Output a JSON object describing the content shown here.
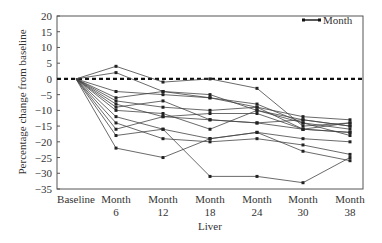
{
  "chart_data": {
    "type": "line",
    "title": "",
    "xlabel": "Liver",
    "ylabel": "Percentage change from baseline",
    "categories": [
      "Baseline",
      "Month 6",
      "Month 12",
      "Month 18",
      "Month 24",
      "Month 30",
      "Month 38"
    ],
    "category_lines": [
      [
        "Baseline"
      ],
      [
        "Month",
        "6"
      ],
      [
        "Month",
        "12"
      ],
      [
        "Month",
        "18"
      ],
      [
        "Month",
        "24"
      ],
      [
        "Month",
        "30"
      ],
      [
        "Month",
        "38"
      ]
    ],
    "ylim": [
      -35,
      20
    ],
    "yticks": [
      20,
      15,
      10,
      5,
      0,
      -5,
      -10,
      -15,
      -20,
      -25,
      -30,
      -35
    ],
    "reference_line": {
      "y": 0,
      "style": "dashed"
    },
    "legend": {
      "entries": [
        "Month"
      ],
      "position": "top-right"
    },
    "grid": false,
    "series": [
      {
        "name": "Patient 1",
        "values": [
          0,
          4,
          -1,
          0,
          -3,
          -15,
          -14
        ]
      },
      {
        "name": "Patient 2",
        "values": [
          0,
          2,
          -4,
          -5,
          -10,
          -13,
          -15
        ]
      },
      {
        "name": "Patient 3",
        "values": [
          0,
          -4,
          -5,
          -6,
          -8,
          -14,
          -16
        ]
      },
      {
        "name": "Patient 4",
        "values": [
          0,
          -7,
          -9,
          -10,
          -9,
          -12,
          -13
        ]
      },
      {
        "name": "Patient 5",
        "values": [
          0,
          -8,
          -12,
          -11,
          -11,
          -16,
          -17
        ]
      },
      {
        "name": "Patient 6",
        "values": [
          0,
          -9,
          -7,
          -13,
          -14,
          -13,
          -15
        ]
      },
      {
        "name": "Patient 7",
        "values": [
          0,
          -10,
          -11,
          -16,
          -10,
          -14,
          -18
        ]
      },
      {
        "name": "Patient 8",
        "values": [
          0,
          -12,
          -16,
          -19,
          -17,
          -19,
          -20
        ]
      },
      {
        "name": "Patient 9",
        "values": [
          0,
          -14,
          -19,
          -20,
          -19,
          -21,
          -24
        ]
      },
      {
        "name": "Patient 10",
        "values": [
          0,
          -16,
          -12,
          -13,
          -14,
          -16,
          -14
        ]
      },
      {
        "name": "Patient 11",
        "values": [
          0,
          -18,
          -16,
          -31,
          -31,
          -33,
          -25
        ]
      },
      {
        "name": "Patient 12",
        "values": [
          0,
          -22,
          -25,
          -19,
          -17,
          -23,
          -26
        ]
      },
      {
        "name": "Patient 13",
        "values": [
          0,
          -6,
          -4,
          -6,
          -9,
          -16,
          -17
        ]
      }
    ]
  }
}
